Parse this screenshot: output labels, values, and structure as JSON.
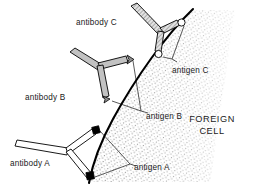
{
  "figure": {
    "background_color": "#ffffff",
    "line_color": "#000000",
    "stipple_color": "#7a7a7a"
  },
  "cell": {
    "name": "FOREIGN CELL",
    "label_line_1": "FOREIGN",
    "label_line_2": "CELL",
    "membrane_description": "thick curved membrane arc",
    "interior_fill": "stippled texture"
  },
  "antibodies": [
    {
      "id": "A",
      "label": "antibody A",
      "fill_style": "white",
      "fill_color": "#ffffff",
      "tip_shape": "square",
      "tip_color": "#000000",
      "bound_antigen": "antigen A"
    },
    {
      "id": "B",
      "label": "antibody B",
      "fill_style": "solid-gray",
      "fill_color": "#b8b8b8",
      "tip_shape": "arrow",
      "tip_color": "#8a8a8a",
      "bound_antigen": "antigen B"
    },
    {
      "id": "C",
      "label": "antibody C",
      "fill_style": "hatched",
      "fill_color": "#d0d0d0",
      "tip_shape": "circle",
      "tip_color": "#ffffff",
      "bound_antigen": "antigen C"
    }
  ],
  "antigens": [
    {
      "id": "A",
      "label": "antigen A",
      "marker_shape": "square",
      "marker_color": "#000000",
      "count": 2
    },
    {
      "id": "B",
      "label": "antigen B",
      "marker_shape": "arrow-notch",
      "marker_color": "#555555",
      "count": 2
    },
    {
      "id": "C",
      "label": "antigen C",
      "marker_shape": "circle",
      "marker_color": "#ffffff",
      "count": 2
    }
  ],
  "labels": {
    "antibody_a": "antibody A",
    "antibody_b": "antibody B",
    "antibody_c": "antibody C",
    "antigen_a": "antigen A",
    "antigen_b": "antigen B",
    "antigen_c": "antigen C",
    "foreign_line1": "FOREIGN",
    "foreign_line2": "CELL"
  }
}
